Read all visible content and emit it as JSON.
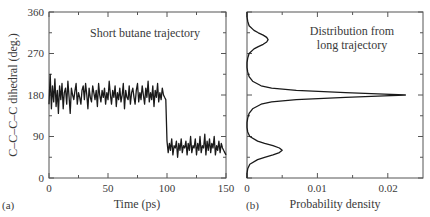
{
  "chart_data": [
    {
      "panel": "(a)",
      "type": "line",
      "title": "Short butane trajectory",
      "xlabel": "Time (ps)",
      "ylabel": "C–C–C–C dihedral (deg.)",
      "xlim": [
        0,
        150
      ],
      "ylim": [
        0,
        360
      ],
      "xticks": [
        0,
        50,
        100,
        150
      ],
      "xticks_minor": [
        25,
        75,
        125
      ],
      "yticks": [
        0,
        90,
        180,
        270,
        360
      ],
      "yticks_minor": [
        45,
        135,
        225,
        315
      ],
      "grid": false,
      "x": [
        0,
        1,
        2,
        3,
        4,
        5,
        6,
        7,
        8,
        9,
        10,
        11,
        12,
        13,
        14,
        15,
        16,
        17,
        18,
        19,
        20,
        21,
        22,
        23,
        24,
        25,
        26,
        27,
        28,
        29,
        30,
        31,
        32,
        33,
        34,
        35,
        36,
        37,
        38,
        39,
        40,
        41,
        42,
        43,
        44,
        45,
        46,
        47,
        48,
        49,
        50,
        51,
        52,
        53,
        54,
        55,
        56,
        57,
        58,
        59,
        60,
        61,
        62,
        63,
        64,
        65,
        66,
        67,
        68,
        69,
        70,
        71,
        72,
        73,
        74,
        75,
        76,
        77,
        78,
        79,
        80,
        81,
        82,
        83,
        84,
        85,
        86,
        87,
        88,
        89,
        90,
        91,
        92,
        93,
        94,
        95,
        96,
        97,
        98,
        99,
        100,
        101,
        102,
        103,
        104,
        105,
        106,
        107,
        108,
        109,
        110,
        111,
        112,
        113,
        114,
        115,
        116,
        117,
        118,
        119,
        120,
        121,
        122,
        123,
        124,
        125,
        126,
        127,
        128,
        129,
        130,
        131,
        132,
        133,
        134,
        135,
        136,
        137,
        138,
        139,
        140,
        141,
        142,
        143,
        144,
        145,
        146,
        147,
        148,
        149,
        150
      ],
      "values": [
        160,
        225,
        150,
        200,
        165,
        215,
        155,
        190,
        140,
        200,
        170,
        205,
        150,
        185,
        195,
        160,
        210,
        175,
        140,
        195,
        180,
        170,
        190,
        205,
        160,
        185,
        175,
        160,
        190,
        200,
        170,
        205,
        180,
        150,
        195,
        175,
        165,
        200,
        185,
        170,
        190,
        155,
        205,
        180,
        165,
        190,
        175,
        195,
        160,
        185,
        170,
        210,
        180,
        160,
        190,
        175,
        200,
        155,
        185,
        170,
        195,
        165,
        180,
        205,
        150,
        190,
        175,
        170,
        200,
        160,
        185,
        195,
        175,
        160,
        190,
        205,
        165,
        185,
        170,
        200,
        180,
        160,
        195,
        175,
        210,
        165,
        185,
        170,
        200,
        155,
        190,
        175,
        205,
        165,
        185,
        170,
        195,
        180,
        175,
        170,
        80,
        55,
        75,
        60,
        85,
        50,
        70,
        65,
        80,
        45,
        75,
        60,
        85,
        55,
        70,
        65,
        80,
        50,
        75,
        60,
        90,
        55,
        70,
        65,
        85,
        50,
        75,
        60,
        90,
        55,
        70,
        65,
        95,
        50,
        80,
        60,
        85,
        55,
        75,
        65,
        90,
        50,
        70,
        60,
        80,
        55,
        75,
        65,
        60,
        55,
        50
      ],
      "annotations": [
        "Short butane trajectory"
      ]
    },
    {
      "panel": "(b)",
      "type": "line",
      "title": "Distribution from long trajectory",
      "xlabel": "Probability density",
      "ylabel": "",
      "xlim": [
        0,
        0.025
      ],
      "ylim": [
        0,
        360
      ],
      "xticks": [
        0,
        0.01,
        0.02
      ],
      "xtick_labels": [
        "0",
        "0.01",
        "0.02"
      ],
      "xticks_minor": [
        0.005,
        0.015
      ],
      "yticks": [
        0,
        90,
        180,
        270,
        360
      ],
      "yticks_minor": [
        45,
        135,
        225,
        315
      ],
      "grid": false,
      "orientation": "horizontal-density (x = density, y = dihedral)",
      "peaks": [
        {
          "dihedral": 60,
          "density": 0.005
        },
        {
          "dihedral": 180,
          "density": 0.0225
        },
        {
          "dihedral": 300,
          "density": 0.003
        }
      ],
      "y": [
        0,
        10,
        20,
        30,
        40,
        45,
        50,
        55,
        60,
        65,
        70,
        75,
        80,
        90,
        100,
        110,
        120,
        130,
        140,
        150,
        160,
        165,
        170,
        175,
        178,
        180,
        182,
        185,
        190,
        195,
        200,
        210,
        220,
        230,
        240,
        250,
        260,
        270,
        280,
        285,
        290,
        295,
        300,
        305,
        310,
        315,
        320,
        330,
        340,
        350,
        360
      ],
      "values": [
        0,
        0,
        0.0001,
        0.0004,
        0.0015,
        0.0025,
        0.0037,
        0.0046,
        0.005,
        0.0046,
        0.0037,
        0.0025,
        0.0015,
        0.0004,
        0.0001,
        0,
        0,
        0.0001,
        0.0003,
        0.0008,
        0.002,
        0.0035,
        0.007,
        0.014,
        0.0195,
        0.0225,
        0.0195,
        0.014,
        0.007,
        0.0035,
        0.002,
        0.0008,
        0.0003,
        0.0001,
        0,
        0,
        0.0001,
        0.0003,
        0.001,
        0.0016,
        0.0023,
        0.0028,
        0.003,
        0.0028,
        0.0023,
        0.0016,
        0.001,
        0.0003,
        0.0001,
        0,
        0
      ],
      "annotations": [
        "Distribution from",
        "long trajectory"
      ]
    }
  ],
  "figure": {
    "panel_a": {
      "label": "(a)",
      "title": "Short butane trajectory",
      "xlabel": "Time (ps)",
      "ylabel": "C–C–C–C dihedral (deg.)",
      "xtick_labels": [
        "0",
        "50",
        "100",
        "150"
      ],
      "ytick_labels": [
        "0",
        "90",
        "180",
        "270",
        "360"
      ]
    },
    "panel_b": {
      "label": "(b)",
      "title_line1": "Distribution from",
      "title_line2": "long trajectory",
      "xlabel": "Probability density",
      "xtick_labels": [
        "0",
        "0.01",
        "0.02"
      ]
    },
    "colors": {
      "line": "#1a1a1a",
      "axis": "#555555",
      "text": "#3a3a3a",
      "background": "#ffffff"
    }
  }
}
